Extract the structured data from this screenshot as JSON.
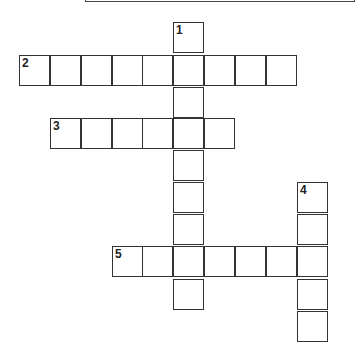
{
  "puzzle": {
    "type": "crossword",
    "cell_size": 31,
    "words": [
      {
        "number": "1",
        "direction": "down",
        "length": 9,
        "start": {
          "x": 173,
          "y": 22
        }
      },
      {
        "number": "2",
        "direction": "across",
        "length": 9,
        "start": {
          "x": 19,
          "y": 55
        }
      },
      {
        "number": "3",
        "direction": "across",
        "length": 6,
        "start": {
          "x": 50,
          "y": 118
        }
      },
      {
        "number": "4",
        "direction": "down",
        "length": 5,
        "start": {
          "x": 297,
          "y": 182
        }
      },
      {
        "number": "5",
        "direction": "across",
        "length": 7,
        "start": {
          "x": 112,
          "y": 246
        }
      }
    ],
    "cells": [
      {
        "x": 173,
        "y": 22,
        "num": "1",
        "letter": ""
      },
      {
        "x": 19,
        "y": 55,
        "num": "2",
        "letter": ""
      },
      {
        "x": 50,
        "y": 55,
        "num": "",
        "letter": ""
      },
      {
        "x": 81,
        "y": 55,
        "num": "",
        "letter": ""
      },
      {
        "x": 112,
        "y": 55,
        "num": "",
        "letter": ""
      },
      {
        "x": 142,
        "y": 55,
        "num": "",
        "letter": ""
      },
      {
        "x": 173,
        "y": 55,
        "num": "",
        "letter": ""
      },
      {
        "x": 204,
        "y": 55,
        "num": "",
        "letter": ""
      },
      {
        "x": 235,
        "y": 55,
        "num": "",
        "letter": ""
      },
      {
        "x": 266,
        "y": 55,
        "num": "",
        "letter": ""
      },
      {
        "x": 173,
        "y": 87,
        "num": "",
        "letter": ""
      },
      {
        "x": 50,
        "y": 118,
        "num": "3",
        "letter": ""
      },
      {
        "x": 81,
        "y": 118,
        "num": "",
        "letter": ""
      },
      {
        "x": 112,
        "y": 118,
        "num": "",
        "letter": ""
      },
      {
        "x": 142,
        "y": 118,
        "num": "",
        "letter": ""
      },
      {
        "x": 173,
        "y": 118,
        "num": "",
        "letter": ""
      },
      {
        "x": 204,
        "y": 118,
        "num": "",
        "letter": ""
      },
      {
        "x": 173,
        "y": 150,
        "num": "",
        "letter": ""
      },
      {
        "x": 173,
        "y": 182,
        "num": "",
        "letter": ""
      },
      {
        "x": 297,
        "y": 182,
        "num": "4",
        "letter": ""
      },
      {
        "x": 173,
        "y": 214,
        "num": "",
        "letter": ""
      },
      {
        "x": 297,
        "y": 214,
        "num": "",
        "letter": ""
      },
      {
        "x": 112,
        "y": 246,
        "num": "5",
        "letter": ""
      },
      {
        "x": 142,
        "y": 246,
        "num": "",
        "letter": ""
      },
      {
        "x": 173,
        "y": 246,
        "num": "",
        "letter": ""
      },
      {
        "x": 204,
        "y": 246,
        "num": "",
        "letter": ""
      },
      {
        "x": 235,
        "y": 246,
        "num": "",
        "letter": ""
      },
      {
        "x": 266,
        "y": 246,
        "num": "",
        "letter": ""
      },
      {
        "x": 297,
        "y": 246,
        "num": "",
        "letter": ""
      },
      {
        "x": 173,
        "y": 279,
        "num": "",
        "letter": ""
      },
      {
        "x": 297,
        "y": 279,
        "num": "",
        "letter": ""
      },
      {
        "x": 297,
        "y": 311,
        "num": "",
        "letter": ""
      }
    ]
  },
  "colors": {
    "border": "#333333",
    "background": "#ffffff",
    "number": "#222222"
  }
}
